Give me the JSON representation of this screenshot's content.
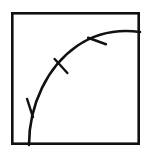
{
  "figure": {
    "type": "geometry-diagram",
    "canvas": {
      "width": 154,
      "height": 155,
      "background": "#ffffff"
    },
    "colors": {
      "ink": "#111111",
      "paper": "#ffffff"
    },
    "square": {
      "name": "bounding-square",
      "left": 11,
      "top": 12,
      "right": 140,
      "bottom": 145,
      "width": 129,
      "height": 133,
      "stroke_width": 2.6,
      "fill": "none"
    },
    "arc": {
      "name": "circular-arc",
      "start_point": [
        29,
        145
      ],
      "end_point": [
        140,
        32
      ],
      "radius": 114,
      "center": [
        143,
        146
      ],
      "sweep": "concave-toward-bottom-right",
      "stroke_width": 2.6,
      "path": "M 29 145 C 29 104 48 66 77 46 C 96 33 118 29 140 32"
    },
    "tick_marks": [
      {
        "name": "tick-1",
        "position": [
          30,
          108
        ],
        "angle_deg": 108,
        "length": 19
      },
      {
        "name": "tick-2",
        "position": [
          61,
          66
        ],
        "angle_deg": 132,
        "length": 19
      },
      {
        "name": "tick-3",
        "position": [
          97,
          41
        ],
        "angle_deg": 160,
        "length": 19
      }
    ],
    "tick_count": 3
  }
}
